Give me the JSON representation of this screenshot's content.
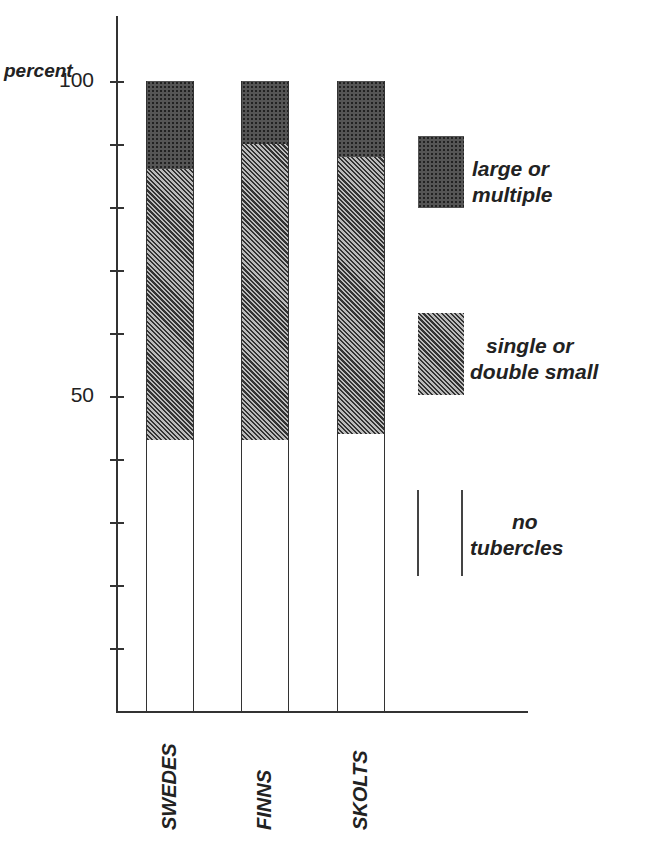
{
  "chart_data": {
    "type": "bar",
    "stacked": true,
    "title": "",
    "ylabel": "percent",
    "xlabel": "",
    "ylim": [
      0,
      100
    ],
    "yticks": [
      0,
      10,
      20,
      30,
      40,
      50,
      60,
      70,
      80,
      90,
      100
    ],
    "ytick_labels": {
      "50": "50",
      "100": "100"
    },
    "categories": [
      "SWEDES",
      "FINNS",
      "SKOLTS"
    ],
    "series": [
      {
        "name": "no tubercles",
        "values": [
          43,
          43,
          44
        ],
        "pattern": "white"
      },
      {
        "name": "single or double small",
        "values": [
          43,
          47,
          44
        ],
        "pattern": "diagonal-hatch"
      },
      {
        "name": "large or multiple",
        "values": [
          14,
          10,
          12
        ],
        "pattern": "cross-hatch"
      }
    ],
    "legend_position": "right",
    "grid": false
  },
  "axis": {
    "ylabel": "percent",
    "tick_100": "100",
    "tick_50": "50"
  },
  "legend": {
    "large_line1": "large or",
    "large_line2": "multiple",
    "single_line1": "single or",
    "single_line2": "double small",
    "none_line1": "no",
    "none_line2": "tubercles"
  },
  "colors": {
    "ink": "#222222",
    "background": "#ffffff"
  }
}
